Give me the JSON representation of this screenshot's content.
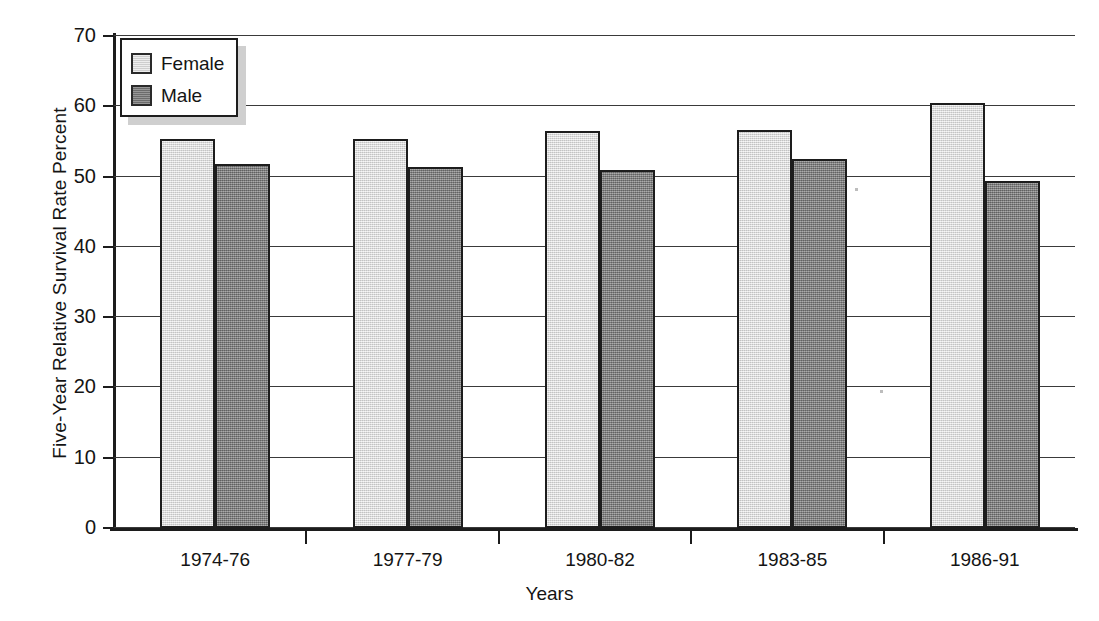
{
  "chart_data": {
    "type": "bar",
    "title": "",
    "xlabel": "Years",
    "ylabel": "Five-Year Relative Survival Rate Percent",
    "categories": [
      "1974-76",
      "1977-79",
      "1980-82",
      "1983-85",
      "1986-91"
    ],
    "series": [
      {
        "name": "Female",
        "values": [
          55.3,
          55.4,
          56.5,
          56.6,
          60.4
        ],
        "color": "#dcdcdc"
      },
      {
        "name": "Male",
        "values": [
          51.8,
          51.3,
          50.9,
          52.5,
          49.4
        ],
        "color": "#7d7d7d"
      }
    ],
    "ylim": [
      0,
      70
    ],
    "ytick_labels": [
      "70",
      "60",
      "50",
      "40",
      "30",
      "20",
      "10",
      "0"
    ],
    "ytick_values": [
      70,
      60,
      50,
      40,
      30,
      20,
      10,
      0
    ],
    "grid": true,
    "grid_axis": "y",
    "legend": {
      "position": "top-left",
      "entries": [
        "Female",
        "Male"
      ]
    }
  },
  "legend": {
    "entries": [
      {
        "label": "Female",
        "swatch": "legend-swatch-female"
      },
      {
        "label": "Male",
        "swatch": "legend-swatch-male"
      }
    ]
  }
}
